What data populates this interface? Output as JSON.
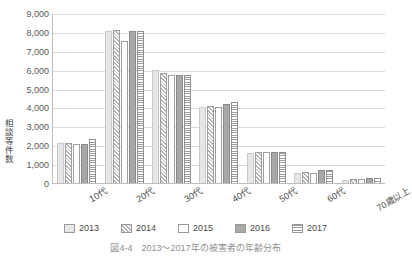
{
  "chart_data": {
    "type": "bar",
    "title": "",
    "xlabel": "",
    "ylabel": "相談等件数",
    "ylim": [
      0,
      9000
    ],
    "ytick_values": [
      9000,
      8000,
      7000,
      6000,
      5000,
      4000,
      3000,
      2000,
      1000,
      0
    ],
    "ytick_labels": [
      "9,000",
      "8,000",
      "7,000",
      "6,000",
      "5,000",
      "4,000",
      "3,000",
      "2,000",
      "1,000",
      "0"
    ],
    "grid": true,
    "legend_position": "bottom",
    "categories": [
      "10代",
      "20代",
      "30代",
      "40代",
      "50代",
      "60代",
      "70歳以上"
    ],
    "series": [
      {
        "name": "2013",
        "values": [
          2100,
          8050,
          6000,
          4050,
          1600,
          550,
          150
        ]
      },
      {
        "name": "2014",
        "values": [
          2120,
          8100,
          5850,
          4100,
          1650,
          600,
          200
        ]
      },
      {
        "name": "2015",
        "values": [
          2050,
          7500,
          5700,
          4000,
          1620,
          520,
          230
        ]
      },
      {
        "name": "2016",
        "values": [
          2060,
          8050,
          5700,
          4200,
          1660,
          700,
          260
        ]
      },
      {
        "name": "2017",
        "values": [
          2320,
          8050,
          5700,
          4300,
          1660,
          680,
          260
        ]
      }
    ]
  },
  "legend": {
    "items": [
      {
        "label": "2013",
        "pattern": "solid-light-gray"
      },
      {
        "label": "2014",
        "pattern": "diagonal-hatch"
      },
      {
        "label": "2015",
        "pattern": "empty-white"
      },
      {
        "label": "2016",
        "pattern": "solid-medium-gray"
      },
      {
        "label": "2017",
        "pattern": "horizontal-lines"
      }
    ]
  },
  "caption": {
    "text": "図4-4　2013～2017年の被害者の年齢分布"
  },
  "colors": {
    "s2013": "#e6e6e6",
    "s2015": "#ffffff",
    "s2016": "#a8a8a8",
    "axis": "#bdbdbd",
    "grid": "#d9d9d9",
    "text": "#4a4a4a"
  }
}
